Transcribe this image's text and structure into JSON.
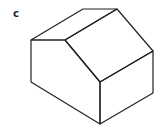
{
  "figure": {
    "label": "c",
    "stroke_color": "#222222",
    "background": "#ffffff"
  }
}
